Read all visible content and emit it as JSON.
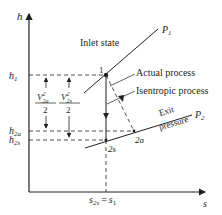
{
  "diagram": {
    "type": "h-s diagram (nozzle expansion)",
    "axes": {
      "x_label": "s",
      "y_label": "h"
    },
    "y_ticks": {
      "h1": "h",
      "h1_sub": "1",
      "h2a": "h",
      "h2a_sub": "2a",
      "h2s": "h",
      "h2s_sub": "2s"
    },
    "x_tick": {
      "left": "s",
      "left_sub": "2s",
      "eq": "=",
      "right": "s",
      "right_sub": "1"
    },
    "isobars": {
      "p1": {
        "label": "P",
        "sub": "1"
      },
      "p2": {
        "label": "P",
        "sub": "2"
      }
    },
    "points": {
      "one": "1",
      "two_s": "2s",
      "two_a": "2a"
    },
    "annotations": {
      "inlet_state": "Inlet state",
      "actual_process": "Actual process",
      "isentropic_process": "Isentropic process",
      "exit": "Exit",
      "pressure": "pressure"
    },
    "kinetic_energy": {
      "actual": {
        "v": "V",
        "sup": "2",
        "sub": "2a",
        "den": "2"
      },
      "isentropic": {
        "v": "V",
        "sup": "2",
        "sub": "2s",
        "den": "2"
      }
    },
    "colors": {
      "line": "#231f20",
      "background": "#ffffff"
    }
  }
}
